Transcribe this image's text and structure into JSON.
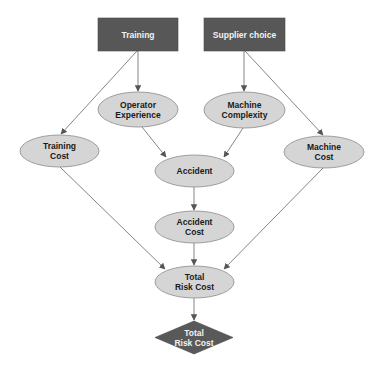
{
  "colors": {
    "decision_fill": "#575757",
    "chance_fill": "#d5d5d5",
    "chance_stroke": "#8a8a8a",
    "utility_fill": "#595959",
    "edge": "#777777",
    "arrowhead": "#555555"
  },
  "nodes": {
    "training": {
      "type": "decision",
      "label": "Training"
    },
    "supplier_choice": {
      "type": "decision",
      "label": "Supplier choice"
    },
    "operator_experience": {
      "type": "chance",
      "label": "Operator\nExperience"
    },
    "machine_complexity": {
      "type": "chance",
      "label": "Machine\nComplexity"
    },
    "training_cost": {
      "type": "chance",
      "label": "Training\nCost"
    },
    "machine_cost": {
      "type": "chance",
      "label": "Machine\nCost"
    },
    "accident": {
      "type": "chance",
      "label": "Accident"
    },
    "accident_cost": {
      "type": "chance",
      "label": "Accident\nCost"
    },
    "total_risk_cost": {
      "type": "chance",
      "label": "Total\nRisk Cost"
    },
    "total_risk_cost_utility": {
      "type": "utility",
      "label": "Total\nRisk Cost"
    }
  },
  "edges": [
    {
      "from": "Training",
      "to": "Operator Experience"
    },
    {
      "from": "Training",
      "to": "Training Cost"
    },
    {
      "from": "Supplier choice",
      "to": "Machine Complexity"
    },
    {
      "from": "Supplier choice",
      "to": "Machine Cost"
    },
    {
      "from": "Operator Experience",
      "to": "Accident"
    },
    {
      "from": "Machine Complexity",
      "to": "Accident"
    },
    {
      "from": "Accident",
      "to": "Accident Cost"
    },
    {
      "from": "Training Cost",
      "to": "Total Risk Cost"
    },
    {
      "from": "Accident Cost",
      "to": "Total Risk Cost"
    },
    {
      "from": "Machine Cost",
      "to": "Total Risk Cost"
    },
    {
      "from": "Total Risk Cost",
      "to": "Total Risk Cost (utility)"
    }
  ]
}
